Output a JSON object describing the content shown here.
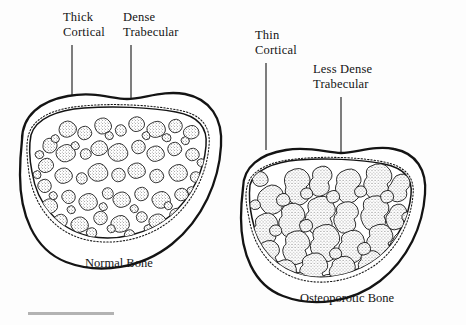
{
  "figure": {
    "type": "medical-illustration",
    "background_color": "#fdfdfd",
    "line_color": "#141414"
  },
  "labels": {
    "thick_cortical": "Thick\nCortical",
    "dense_trabecular": "Dense\nTrabecular",
    "thin_cortical": "Thin\nCortical",
    "less_dense_trabecular": "Less Dense\nTrabecular"
  },
  "captions": {
    "normal_bone": "Normal Bone",
    "osteoporotic_bone": "Osteoporotic Bone"
  },
  "specimens": [
    {
      "name": "normal-bone",
      "caption": "Normal Bone",
      "cortical_thickness": "thick",
      "trabecular_density": "dense",
      "trabecular_island_count": 64,
      "callouts": [
        "Thick\nCortical",
        "Dense\nTrabecular"
      ]
    },
    {
      "name": "osteoporotic-bone",
      "caption": "Osteoporotic Bone",
      "cortical_thickness": "thin",
      "trabecular_density": "less dense",
      "trabecular_island_count": 38,
      "callouts": [
        "Thin\nCortical",
        "Less Dense\nTrabecular"
      ]
    }
  ]
}
